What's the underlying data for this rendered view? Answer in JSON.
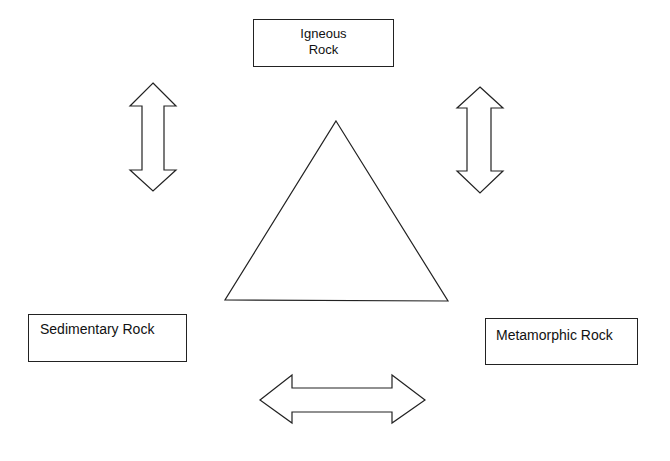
{
  "diagram": {
    "type": "rock-cycle-blank",
    "nodes": [
      {
        "id": "igneous",
        "label_lines": [
          "Igneous",
          "Rock"
        ]
      },
      {
        "id": "sedimentary",
        "label_lines": [
          "Sedimentary Rock"
        ]
      },
      {
        "id": "metamorphic",
        "label_lines": [
          "Metamorphic Rock"
        ]
      }
    ],
    "connectors": [
      {
        "id": "arrow-igneous-sedimentary",
        "shape": "double-headed-vertical-block-arrow",
        "between": [
          "igneous",
          "sedimentary"
        ]
      },
      {
        "id": "arrow-igneous-metamorphic",
        "shape": "double-headed-vertical-block-arrow",
        "between": [
          "igneous",
          "metamorphic"
        ]
      },
      {
        "id": "arrow-sedimentary-metamorphic",
        "shape": "double-headed-horizontal-block-arrow",
        "between": [
          "sedimentary",
          "metamorphic"
        ]
      }
    ],
    "center_shape": "triangle",
    "colors": {
      "stroke": "#222222",
      "fill": "#ffffff",
      "background": "#ffffff"
    }
  }
}
